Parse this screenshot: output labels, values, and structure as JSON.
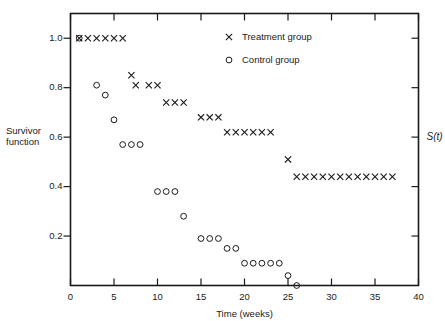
{
  "chart_data": {
    "type": "scatter",
    "title": "",
    "xlabel": "Time (weeks)",
    "ylabel": "Survivor function",
    "ylabel_right": "S(t)",
    "xlim": [
      0,
      40
    ],
    "ylim": [
      0,
      1.1
    ],
    "grid": false,
    "legend_position": "top-right-inside",
    "xticks": [
      0,
      5,
      10,
      15,
      20,
      25,
      30,
      35,
      40
    ],
    "xticklabels": [
      "0",
      "5",
      "10",
      "15",
      "20",
      "25",
      "30",
      "35",
      "40"
    ],
    "yticks": [
      0.2,
      0.4,
      0.6,
      0.8,
      1.0
    ],
    "yticklabels": [
      "0.2",
      "0.4",
      "0.6",
      "0.8",
      "1.0"
    ],
    "series": [
      {
        "name": "Treatment group",
        "marker": "x",
        "color": "#1a1a1a",
        "points": [
          [
            1,
            1.0
          ],
          [
            2,
            1.0
          ],
          [
            3,
            1.0
          ],
          [
            4,
            1.0
          ],
          [
            5,
            1.0
          ],
          [
            6,
            1.0
          ],
          [
            7,
            0.85
          ],
          [
            7.5,
            0.81
          ],
          [
            9,
            0.81
          ],
          [
            10,
            0.81
          ],
          [
            11,
            0.74
          ],
          [
            12,
            0.74
          ],
          [
            13,
            0.74
          ],
          [
            15,
            0.68
          ],
          [
            16,
            0.68
          ],
          [
            17,
            0.68
          ],
          [
            18,
            0.62
          ],
          [
            19,
            0.62
          ],
          [
            20,
            0.62
          ],
          [
            21,
            0.62
          ],
          [
            22,
            0.62
          ],
          [
            23,
            0.62
          ],
          [
            25,
            0.51
          ],
          [
            26,
            0.44
          ],
          [
            27,
            0.44
          ],
          [
            28,
            0.44
          ],
          [
            29,
            0.44
          ],
          [
            30,
            0.44
          ],
          [
            31,
            0.44
          ],
          [
            32,
            0.44
          ],
          [
            33,
            0.44
          ],
          [
            34,
            0.44
          ],
          [
            35,
            0.44
          ],
          [
            36,
            0.44
          ],
          [
            37,
            0.44
          ]
        ]
      },
      {
        "name": "Control group",
        "marker": "o",
        "color": "#1a1a1a",
        "points": [
          [
            1,
            1.0
          ],
          [
            3,
            0.81
          ],
          [
            4,
            0.77
          ],
          [
            5,
            0.67
          ],
          [
            6,
            0.57
          ],
          [
            7,
            0.57
          ],
          [
            8,
            0.57
          ],
          [
            10,
            0.38
          ],
          [
            11,
            0.38
          ],
          [
            12,
            0.38
          ],
          [
            13,
            0.28
          ],
          [
            15,
            0.19
          ],
          [
            16,
            0.19
          ],
          [
            17,
            0.19
          ],
          [
            18,
            0.15
          ],
          [
            19,
            0.15
          ],
          [
            20,
            0.09
          ],
          [
            21,
            0.09
          ],
          [
            22,
            0.09
          ],
          [
            23,
            0.09
          ],
          [
            24,
            0.09
          ],
          [
            25,
            0.04
          ],
          [
            26,
            0.0
          ]
        ]
      }
    ],
    "legend": [
      {
        "label": "Treatment group",
        "marker": "x"
      },
      {
        "label": "Control group",
        "marker": "o"
      }
    ]
  },
  "axes": {
    "left_label_line1": "Survivor",
    "left_label_line2": "function",
    "right_label": "S(t)",
    "bottom_label": "Time (weeks)"
  },
  "legend": {
    "treatment_label": "Treatment group",
    "control_label": "Control group"
  },
  "ticks": {
    "x": [
      "0",
      "5",
      "10",
      "15",
      "20",
      "25",
      "30",
      "35",
      "40"
    ],
    "y": [
      "1.0",
      "0.8",
      "0.6",
      "0.4",
      "0.2"
    ]
  },
  "colors": {
    "ink": "#1a1a1a",
    "background": "#ffffff"
  }
}
